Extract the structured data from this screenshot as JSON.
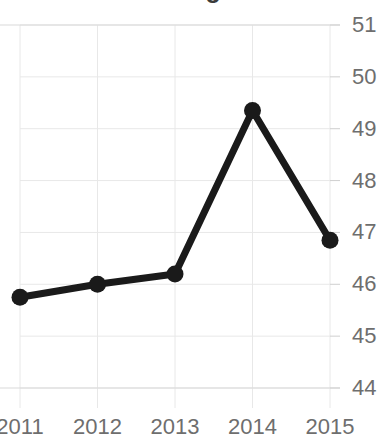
{
  "chart_data": {
    "type": "line",
    "title": "Median Age",
    "xlabel": "",
    "ylabel": "",
    "categories": [
      "2011",
      "2012",
      "2013",
      "2014",
      "2015"
    ],
    "values": [
      45.75,
      46.0,
      46.2,
      49.35,
      46.85
    ],
    "series": [
      {
        "name": "Median Age",
        "values": [
          45.75,
          46.0,
          46.2,
          49.35,
          46.85
        ]
      }
    ],
    "ylim": [
      44,
      51
    ],
    "yticks": [
      44,
      45,
      46,
      47,
      48,
      49,
      50,
      51
    ],
    "ytick_labels": [
      "44",
      "45",
      "46",
      "47",
      "48",
      "49",
      "50",
      "51"
    ],
    "y_axis_position": "right",
    "xtick_labels": [
      "2011",
      "2012",
      "2013",
      "2014",
      "2015"
    ],
    "grid": true,
    "legend": "none",
    "line_color": "#1a1a1a",
    "marker_color": "#1a1a1a",
    "grid_color": "#e8e8e8",
    "label_color": "#6e6e6e",
    "background_color": "#ffffff",
    "title_truncated": true
  }
}
